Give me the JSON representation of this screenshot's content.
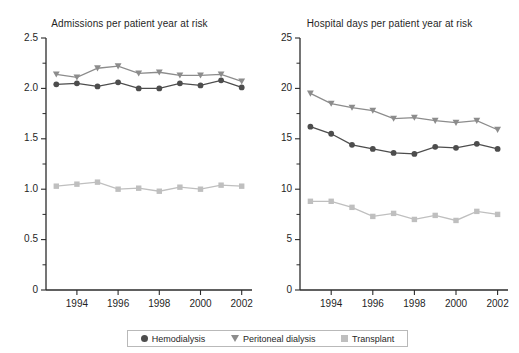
{
  "figure": {
    "width": 519,
    "height": 353,
    "background": "#ffffff"
  },
  "legend": {
    "position": "bottom-center",
    "items": [
      {
        "label": "Hemodialysis",
        "marker": "circle",
        "color": "#4d4d4d"
      },
      {
        "label": "Peritoneal dialysis",
        "marker": "triangle-down",
        "color": "#8c8c8c"
      },
      {
        "label": "Transplant",
        "marker": "square",
        "color": "#bfbfbf"
      }
    ]
  },
  "chart_data": [
    {
      "type": "line",
      "title": "Admissions per patient year at risk",
      "xlabel": "",
      "ylabel": "",
      "x": [
        1993,
        1994,
        1995,
        1996,
        1997,
        1998,
        1999,
        2000,
        2001,
        2002
      ],
      "xlim": [
        1992.5,
        2002.5
      ],
      "xticks": [
        1994,
        1996,
        1998,
        2000,
        2002
      ],
      "ylim": [
        0,
        2.5
      ],
      "yticks": [
        0,
        0.5,
        1.0,
        1.5,
        2.0,
        2.5
      ],
      "ytick_labels": [
        "0",
        "0.5",
        "1.0",
        "1.5",
        "2.0",
        "2.5"
      ],
      "yminor_step": 0.25,
      "grid": false,
      "series": [
        {
          "name": "Hemodialysis",
          "marker": "circle",
          "color": "#4d4d4d",
          "values": [
            2.04,
            2.05,
            2.02,
            2.06,
            2.0,
            2.0,
            2.05,
            2.03,
            2.08,
            2.01
          ]
        },
        {
          "name": "Peritoneal dialysis",
          "marker": "triangle-down",
          "color": "#8c8c8c",
          "values": [
            2.14,
            2.11,
            2.2,
            2.22,
            2.15,
            2.16,
            2.13,
            2.13,
            2.14,
            2.07
          ]
        },
        {
          "name": "Transplant",
          "marker": "square",
          "color": "#bfbfbf",
          "values": [
            1.03,
            1.05,
            1.07,
            1.0,
            1.01,
            0.98,
            1.02,
            1.0,
            1.04,
            1.03
          ]
        }
      ]
    },
    {
      "type": "line",
      "title": "Hospital days per patient year at risk",
      "xlabel": "",
      "ylabel": "",
      "x": [
        1993,
        1994,
        1995,
        1996,
        1997,
        1998,
        1999,
        2000,
        2001,
        2002
      ],
      "xlim": [
        1992.5,
        2002.5
      ],
      "xticks": [
        1994,
        1996,
        1998,
        2000,
        2002
      ],
      "ylim": [
        0,
        25
      ],
      "yticks": [
        0,
        5,
        10,
        15,
        20,
        25
      ],
      "ytick_labels": [
        "0",
        "5",
        "10",
        "15",
        "20",
        "25"
      ],
      "yminor_step": 2.5,
      "grid": false,
      "series": [
        {
          "name": "Hemodialysis",
          "marker": "circle",
          "color": "#4d4d4d",
          "values": [
            16.2,
            15.5,
            14.4,
            14.0,
            13.6,
            13.5,
            14.2,
            14.1,
            14.5,
            14.0
          ]
        },
        {
          "name": "Peritoneal dialysis",
          "marker": "triangle-down",
          "color": "#8c8c8c",
          "values": [
            19.5,
            18.5,
            18.1,
            17.8,
            17.0,
            17.1,
            16.8,
            16.6,
            16.8,
            15.9
          ]
        },
        {
          "name": "Transplant",
          "marker": "square",
          "color": "#bfbfbf",
          "values": [
            8.8,
            8.8,
            8.2,
            7.3,
            7.6,
            7.0,
            7.4,
            6.9,
            7.8,
            7.5
          ]
        }
      ]
    }
  ]
}
